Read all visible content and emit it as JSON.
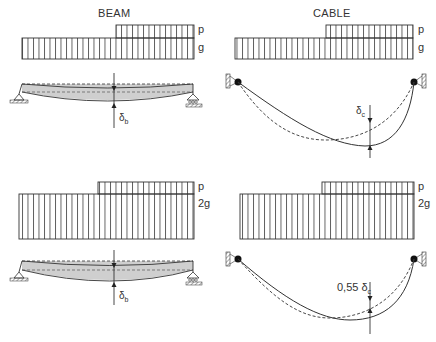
{
  "titles": {
    "beam": "BEAM",
    "cable": "CABLE"
  },
  "panels": {
    "top_beam": {
      "load_labels": {
        "upper": "p",
        "lower": "g"
      },
      "deflection_label": "δ_b"
    },
    "top_cable": {
      "load_labels": {
        "upper": "p",
        "lower": "g"
      },
      "deflection_label": "δ_c"
    },
    "bottom_beam": {
      "load_labels": {
        "upper": "p",
        "lower": "2g"
      },
      "deflection_label": "δ_b"
    },
    "bottom_cable": {
      "load_labels": {
        "upper": "p",
        "lower": "2g"
      },
      "deflection_label": "0,55 δ_c"
    }
  },
  "symbols": {
    "delta_glyph": "δ",
    "sub_b": "b",
    "sub_c": "c",
    "factor": "0,55"
  },
  "colors": {
    "line": "#333333",
    "beam_fill": "#cfcfcf",
    "hatch": "#555555"
  }
}
